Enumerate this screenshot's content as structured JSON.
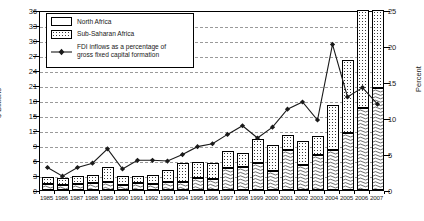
{
  "chart_data": {
    "type": "bar",
    "title": "",
    "subtitle": "",
    "xlabel": "",
    "ylabel": "$ Billions",
    "y2label": "Percent",
    "ylim": [
      0,
      36
    ],
    "ytick_step": 3,
    "yticks": [
      "0",
      "3",
      "6",
      "9",
      "12",
      "15",
      "18",
      "21",
      "24",
      "27",
      "30",
      "33",
      "36"
    ],
    "y2lim": [
      0,
      25
    ],
    "y2tick_step": 5,
    "y2ticks": [
      "0",
      "5",
      "10",
      "15",
      "20",
      "25"
    ],
    "grid": true,
    "grid_style": "dashed-horizontal",
    "legend_position": "top-left-inset",
    "stacked": true,
    "categories": [
      "1985",
      "1986",
      "1987",
      "1988",
      "1989",
      "1990",
      "1991",
      "1992",
      "1993",
      "1994",
      "1995",
      "1996",
      "1997",
      "1998",
      "1999",
      "2000",
      "2001",
      "2002",
      "2003",
      "2004",
      "2005",
      "2006",
      "2007"
    ],
    "series": [
      {
        "name": "Sub-Saharan Africa",
        "axis": "left",
        "units": "$ Billions",
        "pattern": "wave-hatch",
        "values": [
          1.2,
          1.1,
          1.3,
          1.5,
          1.6,
          1.1,
          1.4,
          1.3,
          1.7,
          1.6,
          2.4,
          2.2,
          4.5,
          4.6,
          5.4,
          3.9,
          8.0,
          5.0,
          7.0,
          8.0,
          11.5,
          16.5,
          20.5
        ]
      },
      {
        "name": "North Africa",
        "axis": "left",
        "units": "$ Billions",
        "pattern": "dot-stipple",
        "values": [
          1.5,
          1.4,
          1.5,
          1.6,
          3.1,
          1.7,
          1.5,
          1.7,
          2.4,
          3.8,
          3.2,
          3.2,
          3.4,
          2.9,
          4.9,
          5.2,
          3.0,
          4.8,
          3.8,
          9.0,
          14.5,
          19.5,
          15.5
        ]
      }
    ],
    "line_series": {
      "name": "FDI inflows as a percentage of gross fixed capital formation",
      "label_line1": "FDI inflows as a percentage of",
      "label_line2": "gross fixed capital formation",
      "axis": "right",
      "units": "Percent",
      "marker": "diamond",
      "values": [
        3.4,
        2.2,
        3.4,
        4.0,
        6.0,
        3.2,
        4.4,
        4.4,
        4.3,
        5.2,
        6.3,
        6.7,
        8.0,
        9.2,
        7.5,
        9.0,
        11.5,
        12.5,
        10.0,
        20.5,
        13.2,
        14.5,
        12.2
      ]
    },
    "axis_colors": {
      "grid": "#9a9a9a",
      "axis": "#000000",
      "line": "#1a1a1a",
      "bar_outline": "#000000"
    }
  },
  "legend": {
    "items": [
      {
        "label": "North Africa",
        "key": "swatch-north-africa"
      },
      {
        "label": "Sub-Saharan Africa",
        "key": "swatch-sub-saharan-africa"
      }
    ],
    "line_item": {
      "label_line1": "FDI inflows as a percentage of",
      "label_line2": "gross fixed capital formation",
      "key": "swatch-fdi-line"
    }
  }
}
